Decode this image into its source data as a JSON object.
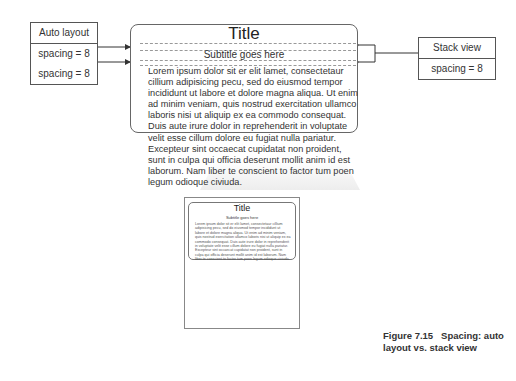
{
  "auto_layout_box": {
    "title": "Auto layout",
    "rows": [
      "spacing = 8",
      "spacing = 8"
    ]
  },
  "stack_view_box": {
    "title": "Stack view",
    "row": "spacing = 8"
  },
  "card": {
    "title": "Title",
    "subtitle": "Subtitle goes here",
    "body": "Lorem ipsum dolor sit er elit lamet, consectetaur cillium adipisicing pecu, sed do eiusmod tempor incididunt ut labore et dolore magna aliqua. Ut enim ad minim veniam, quis nostrud exercitation ullamco laboris nisi ut aliquip ex ea commodo consequat. Duis aute irure dolor in reprehenderit in voluptate velit esse cillum dolore eu fugiat nulla pariatur. Excepteur sint occaecat cupidatat non proident, sunt in culpa qui officia deserunt mollit anim id est laborum. Nam liber te conscient to factor tum poen legum odioque civiuda."
  },
  "caption": {
    "figure": "Figure 7.15",
    "text": "Spacing: auto layout vs. stack view"
  }
}
